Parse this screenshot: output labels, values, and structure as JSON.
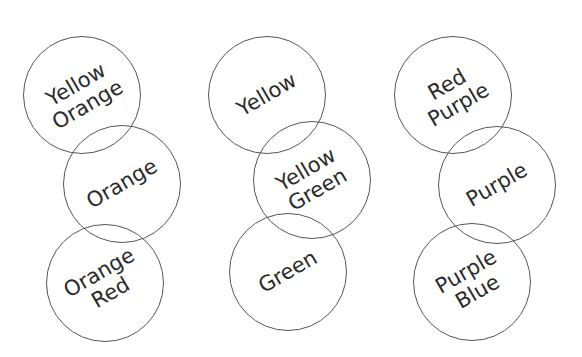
{
  "diagram": {
    "columns": [
      {
        "circles": [
          {
            "lines": [
              "Yellow",
              "Orange"
            ],
            "cx": 82,
            "cy": 95
          },
          {
            "lines": [
              "Orange"
            ],
            "cx": 122,
            "cy": 184
          },
          {
            "lines": [
              "Orange",
              "Red"
            ],
            "cx": 105,
            "cy": 283
          }
        ]
      },
      {
        "circles": [
          {
            "lines": [
              "Yellow"
            ],
            "cx": 267,
            "cy": 95
          },
          {
            "lines": [
              "Yellow",
              "Green"
            ],
            "cx": 312,
            "cy": 180
          },
          {
            "lines": [
              "Green"
            ],
            "cx": 288,
            "cy": 272
          }
        ]
      },
      {
        "circles": [
          {
            "lines": [
              "Red",
              "Purple"
            ],
            "cx": 453,
            "cy": 95
          },
          {
            "lines": [
              "Purple"
            ],
            "cx": 497,
            "cy": 185
          },
          {
            "lines": [
              "Purple",
              "Blue"
            ],
            "cx": 472,
            "cy": 282
          }
        ]
      }
    ],
    "radius": 59,
    "stroke_color": "#555555",
    "text_color": "#2a2a2a"
  }
}
